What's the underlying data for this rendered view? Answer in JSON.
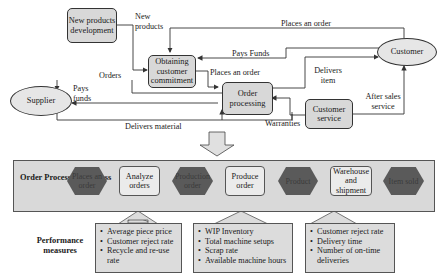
{
  "top_diagram": {
    "nodes": {
      "new_products_development": "New products development",
      "obtaining_commitment": "Obtaining customer commitment",
      "order_processing": "Order processing",
      "customer_service": "Customer service",
      "supplier": "Supplier",
      "customer": "Customer"
    },
    "edges": {
      "new_products": "New products",
      "places_an_order_top": "Places an order",
      "pays_funds_customer": "Pays Funds",
      "places_an_order_mid": "Places an order",
      "orders": "Orders",
      "pays_funds_supplier": "Pays funds",
      "delivers_item": "Delivers item",
      "after_sales_service": "After sales service",
      "warranties": "Warranties",
      "delivers_material": "Delivers material"
    }
  },
  "process": {
    "title": "Order Processing Process",
    "steps": [
      {
        "type": "event",
        "label": "Places an order"
      },
      {
        "type": "activity",
        "label": "Analyze orders"
      },
      {
        "type": "event",
        "label": "Production order"
      },
      {
        "type": "activity",
        "label": "Produce order"
      },
      {
        "type": "event",
        "label": "Product"
      },
      {
        "type": "activity",
        "label": "Warehouse and shipment"
      },
      {
        "type": "event",
        "label": "Item sold"
      }
    ]
  },
  "performance": {
    "title": "Performance measures",
    "groups": [
      {
        "items": [
          "Average piece price",
          "Customer reject rate",
          "Recycle and re-use rate"
        ]
      },
      {
        "items": [
          "WIP Inventory",
          "Total machine setups",
          "Scrap rate",
          "Available machine hours"
        ]
      },
      {
        "items": [
          "Customer reject rate",
          "Delivery time",
          "Number of on-time deliveries"
        ]
      }
    ]
  },
  "colors": {
    "box_fill": "#d8d8d8",
    "event_fill": "#5a5a5a",
    "line": "#333333"
  }
}
